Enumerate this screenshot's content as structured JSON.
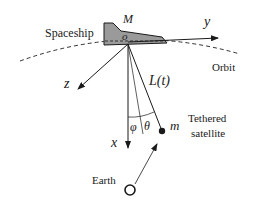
{
  "diagram": {
    "type": "physics schematic",
    "labels": {
      "spaceship": "Spaceship",
      "spaceship_mass": "M",
      "origin": "o",
      "y_axis": "y",
      "z_axis": "z",
      "x_axis": "x",
      "orbit": "Orbit",
      "tether_length": "L(t)",
      "angle_phi": "φ",
      "angle_theta": "θ",
      "satellite_mass": "m",
      "satellite_line1": "Tethered",
      "satellite_line2": "satellite",
      "earth": "Earth"
    },
    "colors": {
      "spaceship_fill": "#9a9a9a",
      "stroke": "#1a1a1a",
      "background": "#ffffff"
    }
  }
}
